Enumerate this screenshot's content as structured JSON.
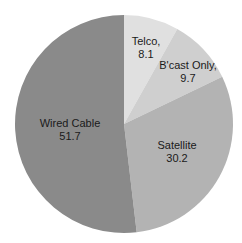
{
  "chart_data": {
    "type": "pie",
    "title": "",
    "start_angle": "12 o'clock",
    "direction": "clockwise",
    "categories": [
      "Telco",
      "B'cast Only",
      "Satellite",
      "Wired Cable"
    ],
    "values": [
      8.1,
      9.7,
      30.2,
      51.7
    ],
    "labels": [
      {
        "name": "Telco,",
        "value": "8.1"
      },
      {
        "name": "B'cast Only,",
        "value": "9.7"
      },
      {
        "name": "Satellite",
        "value": "30.2"
      },
      {
        "name": "Wired Cable",
        "value": "51.7"
      }
    ],
    "colors": [
      "#e0e0e0",
      "#cfcfcf",
      "#b3b3b3",
      "#8a8a8a"
    ],
    "legend": "none (labels inside slices)"
  },
  "layout": {
    "center_x": 124,
    "center_y": 124,
    "radius": 109,
    "label_positions": [
      {
        "x": 146,
        "y": 48
      },
      {
        "x": 188,
        "y": 72
      },
      {
        "x": 177,
        "y": 152
      },
      {
        "x": 70,
        "y": 130
      }
    ]
  }
}
